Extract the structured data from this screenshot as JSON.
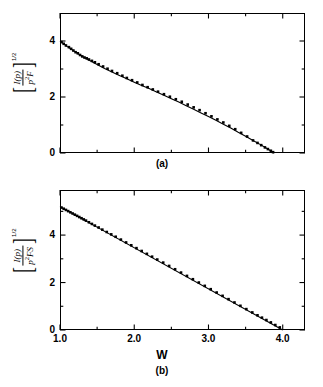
{
  "figure": {
    "panels": [
      {
        "id": "a",
        "caption": "(a)",
        "ylabel_numerator": "I(p)",
        "ylabel_denominator_base": "p",
        "ylabel_denominator_exp": "2",
        "ylabel_denominator_rest": "F",
        "ylabel_exponent": "1/2",
        "ytick_labels": [
          "0",
          "2",
          "4"
        ],
        "xtick_labels": [
          "",
          "",
          "",
          ""
        ]
      },
      {
        "id": "b",
        "caption": "(b)",
        "ylabel_numerator": "I(p)",
        "ylabel_denominator_base": "p",
        "ylabel_denominator_exp": "2",
        "ylabel_denominator_rest": "FS",
        "ylabel_exponent": "1/2",
        "ytick_labels": [
          "0",
          "2",
          "4"
        ],
        "xtick_labels": [
          "1.0",
          "2.0",
          "3.0",
          "4.0"
        ]
      }
    ],
    "xaxis_title": "W",
    "colors": {
      "line": "#000000",
      "marker": "#000000",
      "frame": "#000000",
      "background": "#ffffff"
    }
  },
  "chart_data": [
    {
      "type": "scatter",
      "panel": "a",
      "title": "",
      "xlabel": "W",
      "ylabel": "[I(p)/(p^2 F)]^(1/2)",
      "xlim": [
        1.0,
        4.3
      ],
      "ylim": [
        0,
        5.0
      ],
      "xticks": [
        1.0,
        2.0,
        3.0,
        4.0
      ],
      "xticks_minor": [
        1.5,
        2.5,
        3.5
      ],
      "yticks": [
        0,
        2,
        4
      ],
      "yticks_minor": [
        1,
        3
      ],
      "grid": false,
      "legend": false,
      "series": [
        {
          "name": "fit curve",
          "type": "line",
          "x": [
            1.0,
            1.1,
            1.2,
            1.3,
            1.4,
            1.5,
            1.6,
            1.7,
            1.8,
            1.9,
            2.0,
            2.1,
            2.2,
            2.3,
            2.4,
            2.5,
            2.6,
            2.7,
            2.8,
            2.9,
            3.0,
            3.1,
            3.2,
            3.3,
            3.4,
            3.5,
            3.6,
            3.7,
            3.8,
            3.88
          ],
          "y": [
            4.0,
            3.8,
            3.62,
            3.45,
            3.3,
            3.16,
            3.02,
            2.89,
            2.77,
            2.65,
            2.53,
            2.41,
            2.3,
            2.18,
            2.06,
            1.94,
            1.82,
            1.69,
            1.56,
            1.43,
            1.3,
            1.17,
            1.03,
            0.89,
            0.74,
            0.6,
            0.45,
            0.3,
            0.14,
            0.0
          ]
        },
        {
          "name": "measured points",
          "type": "scatter",
          "x": [
            1.02,
            1.05,
            1.08,
            1.12,
            1.15,
            1.18,
            1.21,
            1.24,
            1.27,
            1.3,
            1.33,
            1.36,
            1.39,
            1.43,
            1.47,
            1.52,
            1.58,
            1.64,
            1.7,
            1.77,
            1.84,
            1.9,
            1.97,
            2.04,
            2.11,
            2.18,
            2.25,
            2.32,
            2.4,
            2.48,
            2.56,
            2.64,
            2.72,
            2.8,
            2.88,
            2.96,
            3.04,
            3.12,
            3.2,
            3.28,
            3.36,
            3.44,
            3.52,
            3.6,
            3.66,
            3.71,
            3.76,
            3.8,
            3.84,
            3.87
          ],
          "y": [
            3.96,
            3.9,
            3.84,
            3.78,
            3.72,
            3.66,
            3.6,
            3.56,
            3.5,
            3.45,
            3.41,
            3.38,
            3.34,
            3.29,
            3.24,
            3.17,
            3.09,
            3.01,
            2.93,
            2.85,
            2.76,
            2.68,
            2.6,
            2.52,
            2.43,
            2.35,
            2.27,
            2.19,
            2.1,
            2.01,
            1.92,
            1.83,
            1.73,
            1.63,
            1.53,
            1.42,
            1.31,
            1.2,
            1.09,
            0.97,
            0.85,
            0.72,
            0.59,
            0.45,
            0.36,
            0.28,
            0.2,
            0.14,
            0.08,
            0.03
          ]
        }
      ]
    },
    {
      "type": "scatter",
      "panel": "b",
      "title": "",
      "xlabel": "W",
      "ylabel": "[I(p)/(p^2 F S)]^(1/2)",
      "xlim": [
        1.0,
        4.3
      ],
      "ylim": [
        0,
        5.9
      ],
      "xticks": [
        1.0,
        2.0,
        3.0,
        4.0
      ],
      "xticks_minor": [
        1.5,
        2.5,
        3.5
      ],
      "yticks": [
        0,
        2,
        4
      ],
      "yticks_minor": [
        1,
        3,
        5
      ],
      "grid": false,
      "legend": false,
      "series": [
        {
          "name": "fit line",
          "type": "line",
          "x": [
            1.0,
            4.0
          ],
          "y": [
            5.2,
            0.0
          ]
        },
        {
          "name": "measured points",
          "type": "scatter",
          "x": [
            1.02,
            1.05,
            1.08,
            1.11,
            1.14,
            1.17,
            1.2,
            1.23,
            1.26,
            1.29,
            1.32,
            1.35,
            1.39,
            1.43,
            1.47,
            1.52,
            1.57,
            1.63,
            1.69,
            1.75,
            1.82,
            1.89,
            1.96,
            2.03,
            2.1,
            2.17,
            2.24,
            2.31,
            2.39,
            2.47,
            2.55,
            2.63,
            2.71,
            2.79,
            2.87,
            2.95,
            3.03,
            3.11,
            3.19,
            3.27,
            3.35,
            3.43,
            3.51,
            3.59,
            3.66,
            3.72,
            3.78,
            3.84,
            3.9,
            3.96
          ],
          "y": [
            5.16,
            5.11,
            5.06,
            5.01,
            4.96,
            4.91,
            4.86,
            4.81,
            4.76,
            4.71,
            4.66,
            4.61,
            4.54,
            4.47,
            4.4,
            4.32,
            4.23,
            4.13,
            4.03,
            3.93,
            3.81,
            3.69,
            3.57,
            3.45,
            3.33,
            3.21,
            3.09,
            2.97,
            2.84,
            2.7,
            2.56,
            2.42,
            2.28,
            2.14,
            2.0,
            1.86,
            1.72,
            1.58,
            1.44,
            1.3,
            1.16,
            1.02,
            0.88,
            0.74,
            0.62,
            0.52,
            0.42,
            0.32,
            0.21,
            0.11
          ]
        }
      ]
    }
  ]
}
